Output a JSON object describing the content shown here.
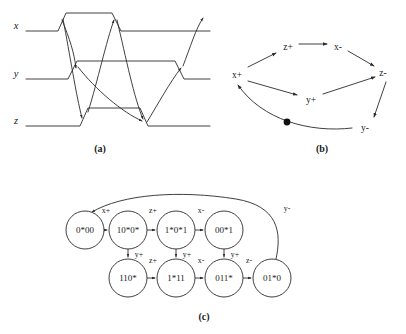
{
  "figure": {
    "panels": [
      {
        "id": "a",
        "caption": "(a)",
        "caption_x": 100,
        "caption_y": 152
      },
      {
        "id": "b",
        "caption": "(b)",
        "caption_x": 322,
        "caption_y": 152
      },
      {
        "id": "c",
        "caption": "(c)",
        "caption_x": 204,
        "caption_y": 320
      }
    ]
  },
  "panel_a": {
    "signals": [
      {
        "name": "x",
        "x": 16,
        "y": 29,
        "baseline_y": 31,
        "high_y": 13
      },
      {
        "name": "y",
        "x": 16,
        "y": 77,
        "baseline_y": 79,
        "high_y": 61
      },
      {
        "name": "z",
        "x": 16,
        "y": 124,
        "baseline_y": 126,
        "high_y": 108
      }
    ]
  },
  "panel_b": {
    "title": "signal-transition-graph",
    "nodes": [
      {
        "id": "x+",
        "label": "x+",
        "x": 237,
        "y": 74
      },
      {
        "id": "z+",
        "label": "z+",
        "x": 288,
        "y": 46
      },
      {
        "id": "x-",
        "label": "x-",
        "x": 338,
        "y": 46
      },
      {
        "id": "z-",
        "label": "z-",
        "x": 383,
        "y": 72
      },
      {
        "id": "y+",
        "label": "y+",
        "x": 311,
        "y": 99
      },
      {
        "id": "y-",
        "label": "y-",
        "x": 365,
        "y": 127
      }
    ],
    "edges": [
      {
        "from": "x+",
        "to": "z+",
        "has_token": false
      },
      {
        "from": "z+",
        "to": "x-",
        "has_token": false
      },
      {
        "from": "x-",
        "to": "z-",
        "has_token": false
      },
      {
        "from": "x+",
        "to": "y+",
        "has_token": false
      },
      {
        "from": "y+",
        "to": "z-",
        "has_token": false
      },
      {
        "from": "z-",
        "to": "y-",
        "has_token": false
      },
      {
        "from": "y-",
        "to": "x+",
        "has_token": true
      }
    ],
    "token": {
      "x": 287,
      "y": 122,
      "radius": 3.4
    }
  },
  "panel_c": {
    "title": "state-graph",
    "nodes": [
      {
        "id": "s0",
        "label": "0*00",
        "cx": 85,
        "cy": 230,
        "r": 19
      },
      {
        "id": "s1",
        "label": "10*0*",
        "cx": 128,
        "cy": 230,
        "r": 19
      },
      {
        "id": "s2",
        "label": "1*0*1",
        "cx": 176,
        "cy": 230,
        "r": 19
      },
      {
        "id": "s3",
        "label": "00*1",
        "cx": 224,
        "cy": 230,
        "r": 19
      },
      {
        "id": "s4",
        "label": "110*",
        "cx": 128,
        "cy": 278,
        "r": 19
      },
      {
        "id": "s5",
        "label": "1*11",
        "cx": 176,
        "cy": 278,
        "r": 19
      },
      {
        "id": "s6",
        "label": "011*",
        "cx": 224,
        "cy": 278,
        "r": 19
      },
      {
        "id": "s7",
        "label": "01*0",
        "cx": 272,
        "cy": 278,
        "r": 19
      }
    ],
    "edges": [
      {
        "from": "s0",
        "to": "s1",
        "label": "x+",
        "lx": 106,
        "ly": 213,
        "kind": "h"
      },
      {
        "from": "s1",
        "to": "s2",
        "label": "z+",
        "lx": 153,
        "ly": 213,
        "kind": "h"
      },
      {
        "from": "s2",
        "to": "s3",
        "label": "x-",
        "lx": 201,
        "ly": 213,
        "kind": "h"
      },
      {
        "from": "s1",
        "to": "s4",
        "label": "y+",
        "lx": 139,
        "ly": 257,
        "kind": "v"
      },
      {
        "from": "s2",
        "to": "s5",
        "label": "y+",
        "lx": 187,
        "ly": 257,
        "kind": "v"
      },
      {
        "from": "s3",
        "to": "s6",
        "label": "y+",
        "lx": 235,
        "ly": 257,
        "kind": "v"
      },
      {
        "from": "s4",
        "to": "s5",
        "label": "z+",
        "lx": 153,
        "ly": 263,
        "kind": "h"
      },
      {
        "from": "s5",
        "to": "s6",
        "label": "x-",
        "lx": 201,
        "ly": 263,
        "kind": "h"
      },
      {
        "from": "s6",
        "to": "s7",
        "label": "z-",
        "lx": 249,
        "ly": 263,
        "kind": "h"
      },
      {
        "from": "s7",
        "to": "s0",
        "label": "y-",
        "lx": 287,
        "ly": 211,
        "kind": "feedback"
      }
    ]
  },
  "style": {
    "ink": "#2a2a2a",
    "text": "#1a1a1a",
    "paper": "#ffffff"
  }
}
